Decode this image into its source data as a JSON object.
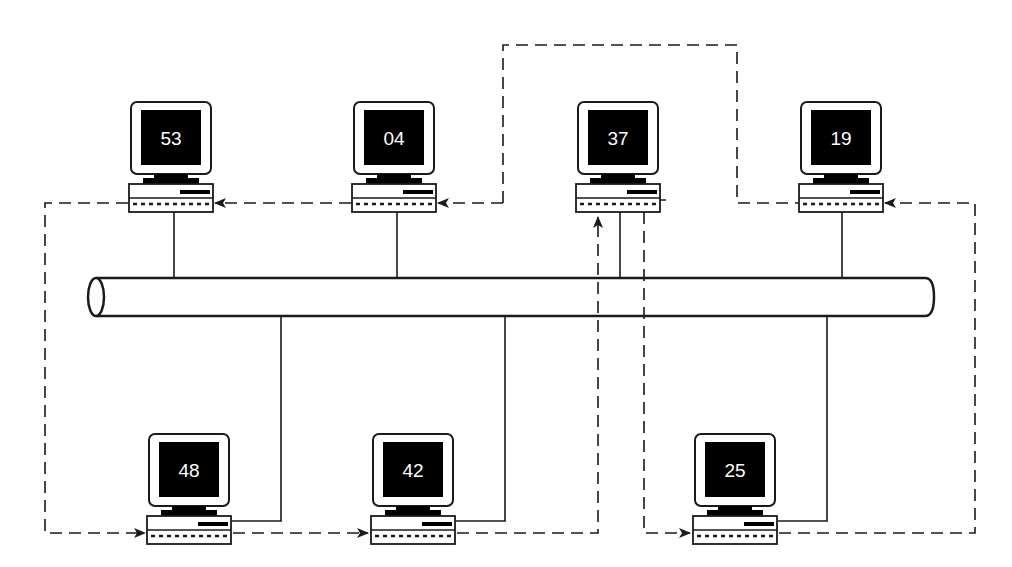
{
  "diagram": {
    "type": "token-ring-over-bus network diagram",
    "bus": {
      "label": ""
    },
    "computers": [
      {
        "id": "53",
        "row": "top"
      },
      {
        "id": "04",
        "row": "top"
      },
      {
        "id": "37",
        "row": "top"
      },
      {
        "id": "19",
        "row": "top"
      },
      {
        "id": "48",
        "row": "bottom"
      },
      {
        "id": "42",
        "row": "bottom"
      },
      {
        "id": "25",
        "row": "bottom"
      }
    ],
    "logical_ring_order": [
      "53",
      "48",
      "42",
      "37",
      "04",
      "53",
      "19",
      "25"
    ],
    "token_passing_sequence": [
      "37",
      "04",
      "53",
      "48",
      "42",
      "37",
      "19",
      "25",
      "19"
    ],
    "colors": {
      "line": "#1a1a1a",
      "screen": "#000000",
      "background": "#ffffff"
    }
  }
}
